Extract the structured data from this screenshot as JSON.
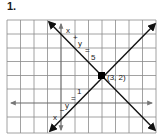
{
  "problem_number": "1.",
  "graph": {
    "grid": {
      "cols": 11,
      "rows": 8,
      "origin_col": 4,
      "origin_row_from_top": 6
    },
    "lines": [
      {
        "name": "descending",
        "equation": "x + y = 5",
        "label_chars": [
          "x",
          "+",
          "y",
          "=",
          "5"
        ]
      },
      {
        "name": "ascending",
        "equation": "x − y = 1",
        "label_chars": [
          "x",
          "−",
          "y",
          "=",
          "1"
        ]
      }
    ],
    "intersection": {
      "label": "(3, 2)",
      "x": 3,
      "y": 2
    }
  },
  "colors": {
    "grid": "#7a7a7a",
    "axis": "#6a6a6a",
    "line": "#111111",
    "point": "#000000"
  }
}
